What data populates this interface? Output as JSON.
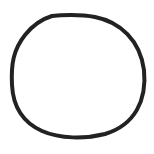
{
  "canvas": {
    "width": 154,
    "height": 154,
    "background": "#ffffff"
  },
  "shape": {
    "type": "circle-outline",
    "style": "hand-drawn",
    "stroke_color": "#222222",
    "stroke_width": 4,
    "fill": "none"
  }
}
